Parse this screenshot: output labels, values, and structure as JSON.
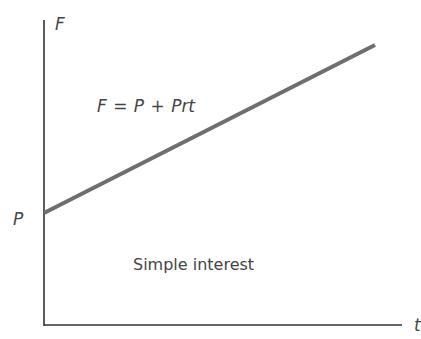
{
  "chart_data": {
    "type": "line",
    "title": "",
    "xlabel": "t",
    "ylabel": "F",
    "y_intercept_label": "P",
    "equation": "F = P + Prt",
    "annotation": "Simple interest",
    "grid": false,
    "legend": null,
    "series": [
      {
        "name": "F = P + Prt",
        "color": "#6e6e6e",
        "points": [
          {
            "x": 0,
            "y": "P"
          },
          {
            "x": "t_max",
            "y": "F_max"
          }
        ],
        "pixel_points": [
          [
            44,
            213
          ],
          [
            375,
            45
          ]
        ]
      }
    ]
  },
  "labels": {
    "y_axis": "F",
    "x_axis": "t",
    "intercept": "P",
    "equation": "F = P + Prt",
    "annotation": "Simple interest"
  }
}
